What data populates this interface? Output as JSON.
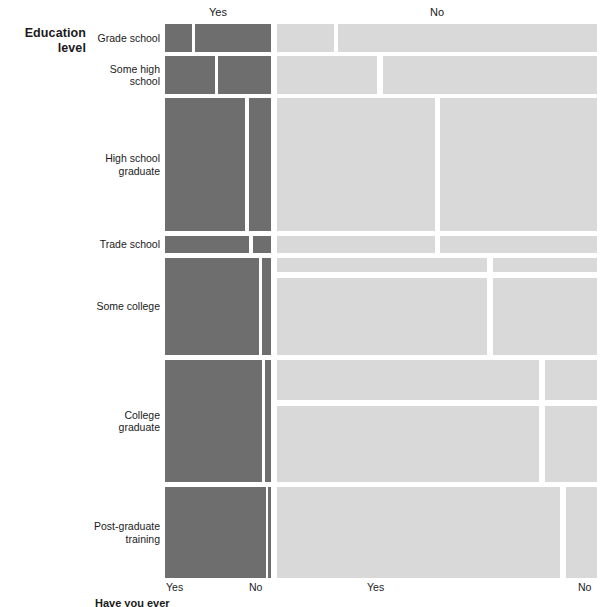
{
  "axes": {
    "y_title": "Education\nlevel",
    "y_title_line1": "Education",
    "y_title_line2": "level",
    "x_title_bottom": "Have you ever",
    "top_headers": [
      {
        "label": "Yes",
        "center_x": 218
      },
      {
        "label": "No",
        "center_x": 437
      }
    ],
    "bottom_ticks": [
      {
        "label": "Yes",
        "x": 166
      },
      {
        "label": "No",
        "x": 249
      },
      {
        "label": "Yes",
        "x": 367
      },
      {
        "label": "No",
        "x": 578
      }
    ]
  },
  "colors": {
    "yes": "#6e6e6e",
    "no": "#d9d9d9",
    "background": "#ffffff",
    "text": "#1a1a1a"
  },
  "rows": [
    {
      "label": "Grade school",
      "label_line1": "Grade school",
      "label_line2": ""
    },
    {
      "label": "Some high school",
      "label_line1": "Some high",
      "label_line2": "school"
    },
    {
      "label": "High school graduate",
      "label_line1": "High school",
      "label_line2": "graduate"
    },
    {
      "label": "Trade school",
      "label_line1": "Trade school",
      "label_line2": ""
    },
    {
      "label": "Some college",
      "label_line1": "Some college",
      "label_line2": ""
    },
    {
      "label": "College graduate",
      "label_line1": "College",
      "label_line2": "graduate"
    },
    {
      "label": "Post-graduate training",
      "label_line1": "Post-graduate",
      "label_line2": "training"
    }
  ],
  "chart_data": {
    "type": "heatmap",
    "subtype": "mosaic",
    "title": "",
    "xlabel": "Have you ever",
    "ylabel": "Education level",
    "row_variable": "Education level",
    "column_variable": "Have you ever",
    "column_groups": [
      "Yes",
      "No"
    ],
    "column_subgroups": [
      "Yes",
      "No"
    ],
    "categories": [
      "Grade school",
      "Some high school",
      "High school graduate",
      "Trade school",
      "Some college",
      "College graduate",
      "Post-graduate training"
    ],
    "row_heights_pct": [
      5.3,
      7.2,
      25.0,
      3.2,
      18.3,
      23.0,
      17.1
    ],
    "cells": [
      {
        "row": "Grade school",
        "group": "Yes",
        "sub": "Yes",
        "value_pct": 21
      },
      {
        "row": "Grade school",
        "group": "Yes",
        "sub": "No",
        "value_pct": 79
      },
      {
        "row": "Grade school",
        "group": "No",
        "sub": "Yes",
        "value_pct": 17
      },
      {
        "row": "Grade school",
        "group": "No",
        "sub": "No",
        "value_pct": 83
      },
      {
        "row": "Some high school",
        "group": "Yes",
        "sub": "Yes",
        "value_pct": 48
      },
      {
        "row": "Some high school",
        "group": "Yes",
        "sub": "No",
        "value_pct": 52
      },
      {
        "row": "Some high school",
        "group": "No",
        "sub": "Yes",
        "value_pct": 33
      },
      {
        "row": "Some high school",
        "group": "No",
        "sub": "No",
        "value_pct": 67
      },
      {
        "row": "High school graduate",
        "group": "Yes",
        "sub": "Yes",
        "value_pct": 81
      },
      {
        "row": "High school graduate",
        "group": "Yes",
        "sub": "No",
        "value_pct": 19
      },
      {
        "row": "High school graduate",
        "group": "No",
        "sub": "Yes",
        "value_pct": 55
      },
      {
        "row": "High school graduate",
        "group": "No",
        "sub": "No",
        "value_pct": 45
      },
      {
        "row": "Trade school",
        "group": "Yes",
        "sub": "Yes",
        "value_pct": 82
      },
      {
        "row": "Trade school",
        "group": "Yes",
        "sub": "No",
        "value_pct": 18
      },
      {
        "row": "Trade school",
        "group": "No",
        "sub": "Yes",
        "value_pct": 55
      },
      {
        "row": "Trade school",
        "group": "No",
        "sub": "No",
        "value_pct": 45
      },
      {
        "row": "Some college",
        "group": "Yes",
        "sub": "Yes",
        "value_pct": 92
      },
      {
        "row": "Some college",
        "group": "Yes",
        "sub": "No",
        "value_pct": 8
      },
      {
        "row": "Some college",
        "group": "No",
        "sub": "Yes",
        "value_pct": 69
      },
      {
        "row": "Some college",
        "group": "No",
        "sub": "No",
        "value_pct": 31
      },
      {
        "row": "College graduate",
        "group": "Yes",
        "sub": "Yes",
        "value_pct": 93
      },
      {
        "row": "College graduate",
        "group": "Yes",
        "sub": "No",
        "value_pct": 7
      },
      {
        "row": "College graduate",
        "group": "No",
        "sub": "Yes",
        "value_pct": 82
      },
      {
        "row": "College graduate",
        "group": "No",
        "sub": "No",
        "value_pct": 18
      },
      {
        "row": "Post-graduate training",
        "group": "Yes",
        "sub": "Yes",
        "value_pct": 95
      },
      {
        "row": "Post-graduate training",
        "group": "Yes",
        "sub": "No",
        "value_pct": 5
      },
      {
        "row": "Post-graduate training",
        "group": "No",
        "sub": "Yes",
        "value_pct": 88
      },
      {
        "row": "Post-graduate training",
        "group": "No",
        "sub": "No",
        "value_pct": 12
      }
    ],
    "grid": false,
    "legend": "none"
  },
  "layout": {
    "row_label_x": 62,
    "rows_px": [
      {
        "top": 24,
        "height": 28
      },
      {
        "top": 56,
        "height": 38
      },
      {
        "top": 98,
        "height": 133
      },
      {
        "top": 236,
        "height": 17
      },
      {
        "top": 258,
        "height": 97
      },
      {
        "top": 360,
        "height": 122
      },
      {
        "top": 487,
        "height": 91
      }
    ],
    "tiles": [
      {
        "row": 0,
        "cls": "yes",
        "left": 165,
        "width": 27
      },
      {
        "row": 0,
        "cls": "yes",
        "left": 195,
        "width": 76
      },
      {
        "row": 0,
        "cls": "no",
        "left": 277,
        "width": 57
      },
      {
        "row": 0,
        "cls": "no",
        "left": 338,
        "width": 259
      },
      {
        "row": 1,
        "cls": "yes",
        "left": 165,
        "width": 50
      },
      {
        "row": 1,
        "cls": "yes",
        "left": 218,
        "width": 53
      },
      {
        "row": 1,
        "cls": "no",
        "left": 277,
        "width": 100
      },
      {
        "row": 1,
        "cls": "no",
        "left": 383,
        "width": 214
      },
      {
        "row": 2,
        "cls": "yes",
        "left": 165,
        "width": 80
      },
      {
        "row": 2,
        "cls": "yes",
        "left": 249,
        "width": 22
      },
      {
        "row": 2,
        "cls": "no",
        "left": 277,
        "width": 158
      },
      {
        "row": 2,
        "cls": "no",
        "left": 440,
        "width": 157
      },
      {
        "row": 3,
        "cls": "yes",
        "left": 165,
        "width": 84
      },
      {
        "row": 3,
        "cls": "yes",
        "left": 253,
        "width": 18
      },
      {
        "row": 3,
        "cls": "no",
        "left": 277,
        "width": 158
      },
      {
        "row": 3,
        "cls": "no",
        "left": 440,
        "width": 157
      },
      {
        "row": 4,
        "cls": "yes",
        "left": 165,
        "width": 94
      },
      {
        "row": 4,
        "cls": "yes",
        "left": 262,
        "width": 9
      },
      {
        "row": 4,
        "cls": "no",
        "left": 277,
        "width": 210
      },
      {
        "row": 4,
        "cls": "no",
        "left": 493,
        "width": 104
      },
      {
        "row": 5,
        "cls": "yes",
        "left": 165,
        "width": 97
      },
      {
        "row": 5,
        "cls": "yes",
        "left": 265,
        "width": 6
      },
      {
        "row": 5,
        "cls": "no",
        "left": 277,
        "width": 262
      },
      {
        "row": 5,
        "cls": "no",
        "left": 545,
        "width": 52
      },
      {
        "row": 6,
        "cls": "yes",
        "left": 165,
        "width": 101
      },
      {
        "row": 6,
        "cls": "yes",
        "left": 268,
        "width": 3
      },
      {
        "row": 6,
        "cls": "no",
        "left": 277,
        "width": 283
      },
      {
        "row": 6,
        "cls": "no",
        "left": 566,
        "width": 31
      }
    ],
    "subrow_splits": [
      {
        "row": 2,
        "split_after_px": 132,
        "second_top_offset": 138
      },
      {
        "row": 4,
        "split_after_px": 14,
        "second_top_offset": 20
      },
      {
        "row": 5,
        "split_after_px": 40,
        "second_top_offset": 46
      }
    ]
  }
}
